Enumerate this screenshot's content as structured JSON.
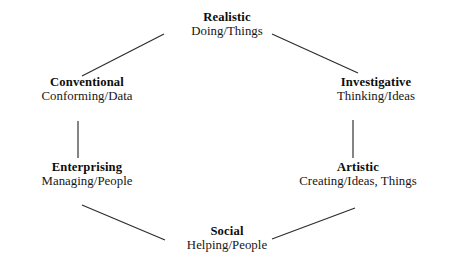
{
  "diagram": {
    "name": "RIASEC Hexagon",
    "shape": "hexagon",
    "background_color": "#ffffff",
    "line_color": "#2b2b2b",
    "text_color": "#141414",
    "nodes": [
      {
        "id": "realistic",
        "title": "Realistic",
        "subtitle": "Doing/Things",
        "position": "top"
      },
      {
        "id": "investigative",
        "title": "Investigative",
        "subtitle": "Thinking/Ideas",
        "position": "upper-right"
      },
      {
        "id": "artistic",
        "title": "Artistic",
        "subtitle": "Creating/Ideas, Things",
        "position": "lower-right"
      },
      {
        "id": "social",
        "title": "Social",
        "subtitle": "Helping/People",
        "position": "bottom"
      },
      {
        "id": "enterprising",
        "title": "Enterprising",
        "subtitle": "Managing/People",
        "position": "lower-left"
      },
      {
        "id": "conventional",
        "title": "Conventional",
        "subtitle": "Conforming/Data",
        "position": "upper-left"
      }
    ],
    "edges": [
      {
        "id": "conventional-realistic",
        "from": "conventional",
        "to": "realistic",
        "x1": 82,
        "y1": 76,
        "x2": 164,
        "y2": 34
      },
      {
        "id": "realistic-investigative",
        "from": "realistic",
        "to": "investigative",
        "x1": 272,
        "y1": 34,
        "x2": 358,
        "y2": 73
      },
      {
        "id": "investigative-artistic",
        "from": "investigative",
        "to": "artistic",
        "x1": 353,
        "y1": 120,
        "x2": 353,
        "y2": 158
      },
      {
        "id": "artistic-social",
        "from": "artistic",
        "to": "social",
        "x1": 355,
        "y1": 208,
        "x2": 272,
        "y2": 239
      },
      {
        "id": "social-enterprising",
        "from": "social",
        "to": "enterprising",
        "x1": 165,
        "y1": 240,
        "x2": 82,
        "y2": 205
      },
      {
        "id": "enterprising-conventional",
        "from": "enterprising",
        "to": "conventional",
        "x1": 78,
        "y1": 158,
        "x2": 78,
        "y2": 121
      }
    ]
  }
}
